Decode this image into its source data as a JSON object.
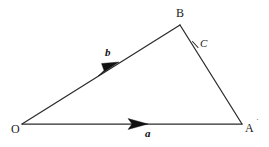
{
  "figure": {
    "name": "vector-triangle-diagram",
    "background_color": "#ffffff",
    "stroke_color": "#2b2b2b",
    "text_color": "#1a1a1a",
    "width": 269,
    "height": 147
  },
  "vertices": {
    "origin": {
      "label": "O",
      "x": 22,
      "y": 124,
      "label_x": 11,
      "label_y": 123
    },
    "top": {
      "label": "B",
      "x": 180,
      "y": 25,
      "label_x": 176,
      "label_y": 7
    },
    "right": {
      "label": "A",
      "x": 242,
      "y": 124,
      "label_x": 245,
      "label_y": 122
    }
  },
  "points": {
    "c": {
      "label": "C",
      "x": 196,
      "y": 45,
      "label_x": 200,
      "label_y": 38
    }
  },
  "marks": {
    "a_prime": {
      "glyph": "˙",
      "x": 259,
      "y": 119
    }
  },
  "vectors": [
    {
      "name": "vector-a",
      "label": "a",
      "from": "O",
      "to": "A",
      "label_x": 145,
      "label_y": 128,
      "arrow_tip_x": 148,
      "arrow_tip_y": 124
    },
    {
      "name": "vector-b",
      "label": "b",
      "from": "O",
      "to": "B",
      "label_x": 105,
      "label_y": 47,
      "arrow_tip_x": 119,
      "arrow_tip_y": 62
    }
  ],
  "segments": [
    {
      "name": "segment-OA",
      "x1": 22,
      "y1": 124,
      "x2": 242,
      "y2": 124
    },
    {
      "name": "segment-OB",
      "x1": 22,
      "y1": 124,
      "x2": 180,
      "y2": 25
    },
    {
      "name": "segment-BA",
      "x1": 180,
      "y1": 25,
      "x2": 242,
      "y2": 124
    }
  ],
  "tick": {
    "name": "tick-at-C",
    "x1": 193,
    "y1": 42,
    "x2": 198,
    "y2": 47
  }
}
